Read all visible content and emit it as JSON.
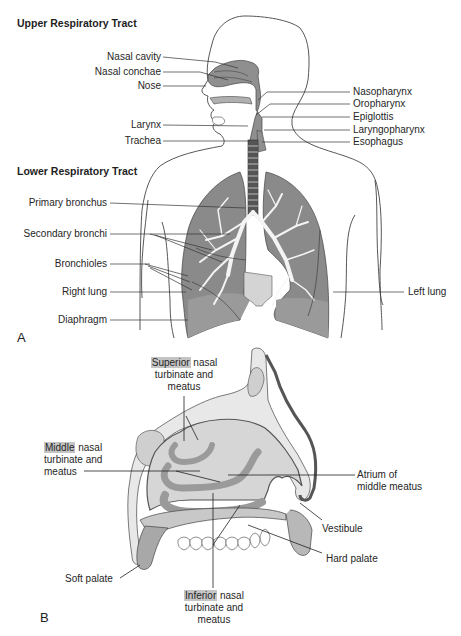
{
  "panel_a": {
    "letter": "A",
    "upper_heading": "Upper Respiratory Tract",
    "lower_heading": "Lower Respiratory Tract",
    "labels_left_upper": [
      "Nasal cavity",
      "Nasal conchae",
      "Nose",
      "Larynx",
      "Trachea"
    ],
    "labels_right_upper": [
      "Nasopharynx",
      "Oropharynx",
      "Epiglottis",
      "Laryngopharynx",
      "Esophagus"
    ],
    "labels_left_lower": [
      "Primary bronchus",
      "Secondary bronchi",
      "Bronchioles",
      "Right lung",
      "Diaphragm"
    ],
    "labels_right_lower": [
      "Left lung"
    ]
  },
  "panel_b": {
    "letter": "B",
    "superior": {
      "highlight": "Superior",
      "rest1": " nasal",
      "line2": "turbinate and",
      "line3": "meatus"
    },
    "middle": {
      "highlight": "Middle",
      "rest1": " nasal",
      "line2": "turbinate and",
      "line3": "meatus"
    },
    "inferior": {
      "highlight": "Inferior",
      "rest1": " nasal",
      "line2": "turbinate and",
      "line3": "meatus"
    },
    "atrium": {
      "line1": "Atrium of",
      "line2": "middle meatus"
    },
    "vestibule": "Vestibule",
    "hard_palate": "Hard palate",
    "soft_palate": "Soft palate"
  },
  "colors": {
    "tissue_dark": "#8a8a8a",
    "tissue_mid": "#a6a6a6",
    "tissue_light": "#d9d9d9",
    "cavity": "#e6e6e6",
    "highlight": "#c4c4c4",
    "line": "#333333"
  }
}
